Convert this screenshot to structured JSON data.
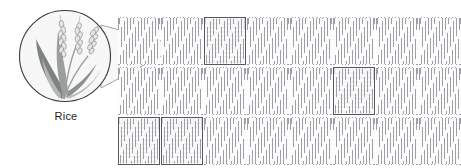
{
  "figure": {
    "type": "crop-field-diagram",
    "background_color": "#ffffff"
  },
  "callout": {
    "label": "Rice",
    "icon": "rice-plant-icon",
    "circle": {
      "cx": 65,
      "cy": 56,
      "r": 46,
      "stroke": "#3f3f3f",
      "fill": "#f7f7f7"
    },
    "cone": {
      "apex_x": 180,
      "apex_y": 46,
      "fill": "#f7f7f7",
      "stroke": "#8d8d8d"
    },
    "plant_color_dark": "#7b7f80",
    "plant_color_light": "#c9ccc9"
  },
  "field": {
    "origin_x": 118,
    "origin_y": 17,
    "columns": 8,
    "rows": 3,
    "plot_width": 42,
    "plot_height": 48,
    "gap_x": 1,
    "gap_y": 2,
    "plot_fill": "#fbfbfb",
    "hatch_color": "#787c82",
    "highlight_border_color": "#55595e",
    "highlighted_plots": [
      {
        "row": 0,
        "col": 2
      },
      {
        "row": 1,
        "col": 5
      },
      {
        "row": 2,
        "col": 0
      },
      {
        "row": 2,
        "col": 1
      }
    ]
  }
}
